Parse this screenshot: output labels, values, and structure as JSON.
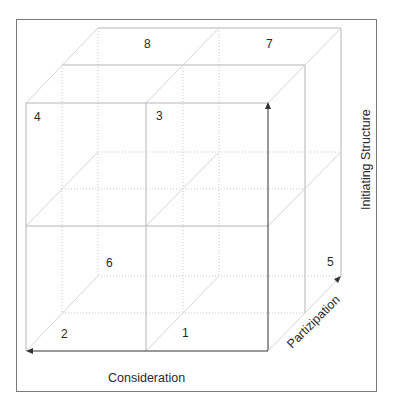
{
  "diagram": {
    "type": "3d-cube-model",
    "cells": [
      {
        "id": "cell-1",
        "label": "1"
      },
      {
        "id": "cell-2",
        "label": "2"
      },
      {
        "id": "cell-3",
        "label": "3"
      },
      {
        "id": "cell-4",
        "label": "4"
      },
      {
        "id": "cell-5",
        "label": "5"
      },
      {
        "id": "cell-6",
        "label": "6"
      },
      {
        "id": "cell-7",
        "label": "7"
      },
      {
        "id": "cell-8",
        "label": "8"
      }
    ],
    "axes": {
      "x": {
        "label": "Consideration"
      },
      "y": {
        "label": "Initiating Structure"
      },
      "z": {
        "label": "Partizipation"
      }
    },
    "colors": {
      "frame": "#7a7a7a",
      "solid_line": "#b5b5b5",
      "dotted_line": "#c8c8c8",
      "diagonal": "#d6d6d6",
      "arrow": "#333333",
      "text": "#2a2a2a"
    }
  }
}
